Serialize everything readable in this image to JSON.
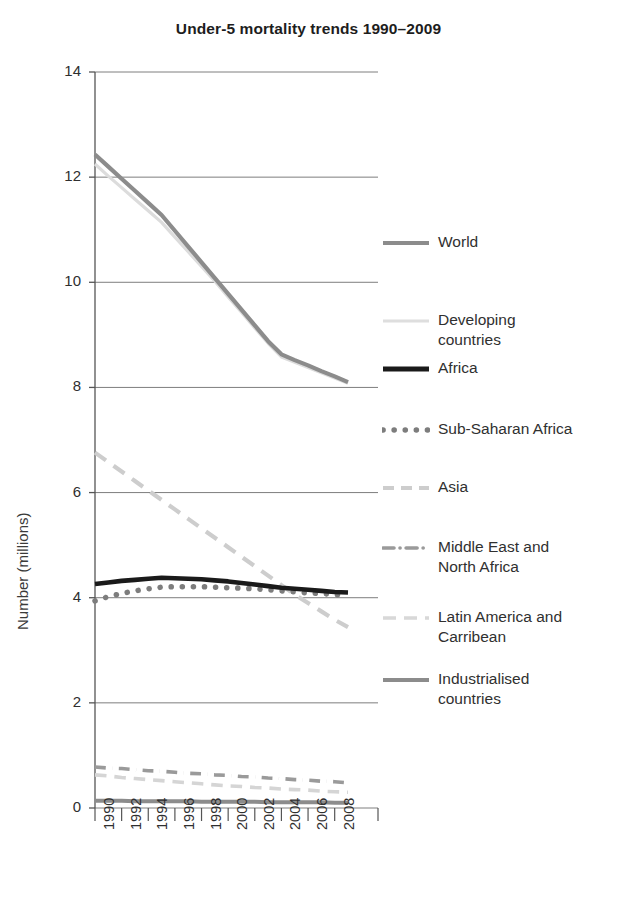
{
  "chart_data": {
    "type": "line",
    "title": "Under-5 mortality trends 1990–2009",
    "xlabel": "",
    "ylabel": "Number (millions)",
    "xlim": [
      1990,
      2009
    ],
    "ylim": [
      0,
      14
    ],
    "grid": true,
    "legend_position": "right",
    "x_ticks": [
      "1990",
      "1992",
      "1994",
      "1996",
      "1998",
      "2000",
      "2002",
      "2004",
      "2006",
      "2008"
    ],
    "y_ticks": [
      "0",
      "2",
      "4",
      "6",
      "8",
      "10",
      "12",
      "14"
    ],
    "x": [
      1990,
      1991,
      1992,
      1993,
      1994,
      1995,
      1996,
      1997,
      1998,
      1999,
      2000,
      2001,
      2002,
      2003,
      2004,
      2005,
      2006,
      2007,
      2008,
      2009
    ],
    "series": [
      {
        "name": "World",
        "style": "solid",
        "color": "#8c8c8c",
        "width": 4.2,
        "values": [
          12.43,
          12.2,
          11.97,
          11.74,
          11.51,
          11.28,
          10.98,
          10.68,
          10.38,
          10.08,
          9.78,
          9.48,
          9.18,
          8.88,
          8.63,
          8.52,
          8.42,
          8.31,
          8.21,
          8.1
        ]
      },
      {
        "name": "Developing countries",
        "style": "solid",
        "color": "#dcdcdc",
        "width": 3.2,
        "values": [
          12.25,
          12.02,
          11.8,
          11.58,
          11.36,
          11.14,
          10.86,
          10.58,
          10.3,
          10.02,
          9.72,
          9.43,
          9.13,
          8.84,
          8.58,
          8.48,
          8.38,
          8.28,
          8.18,
          8.08
        ]
      },
      {
        "name": "Africa",
        "style": "solid",
        "color": "#1a1a1a",
        "width": 4.6,
        "values": [
          4.26,
          4.29,
          4.32,
          4.34,
          4.36,
          4.38,
          4.37,
          4.36,
          4.35,
          4.33,
          4.31,
          4.28,
          4.25,
          4.22,
          4.19,
          4.17,
          4.15,
          4.13,
          4.11,
          4.1
        ]
      },
      {
        "name": "Sub-Saharan Africa",
        "style": "dotted",
        "color": "#7d7d7d",
        "width": 5.5,
        "values": [
          3.94,
          4.02,
          4.08,
          4.13,
          4.17,
          4.2,
          4.21,
          4.21,
          4.21,
          4.2,
          4.19,
          4.18,
          4.17,
          4.15,
          4.13,
          4.11,
          4.09,
          4.08,
          4.06,
          4.05
        ]
      },
      {
        "name": "Asia",
        "style": "dashed",
        "color": "#cdcdcd",
        "width": 4.2,
        "values": [
          6.76,
          6.58,
          6.4,
          6.22,
          6.04,
          5.86,
          5.68,
          5.5,
          5.32,
          5.14,
          4.96,
          4.78,
          4.6,
          4.42,
          4.24,
          4.06,
          3.9,
          3.74,
          3.58,
          3.44
        ]
      },
      {
        "name": "Middle East and North Africa",
        "style": "dashdot",
        "color": "#9a9a9a",
        "width": 3.6,
        "values": [
          0.78,
          0.76,
          0.75,
          0.73,
          0.71,
          0.7,
          0.68,
          0.66,
          0.65,
          0.63,
          0.62,
          0.6,
          0.59,
          0.57,
          0.56,
          0.54,
          0.53,
          0.51,
          0.5,
          0.48
        ]
      },
      {
        "name": "Latin America and Carribean",
        "style": "dashed",
        "color": "#d5d5d5",
        "width": 3.6,
        "values": [
          0.63,
          0.61,
          0.58,
          0.56,
          0.54,
          0.52,
          0.5,
          0.48,
          0.46,
          0.44,
          0.42,
          0.41,
          0.39,
          0.38,
          0.36,
          0.35,
          0.34,
          0.32,
          0.31,
          0.3
        ]
      },
      {
        "name": "Industrialised countries",
        "style": "solid",
        "color": "#8c8c8c",
        "width": 4.0,
        "values": [
          0.14,
          0.14,
          0.14,
          0.13,
          0.13,
          0.13,
          0.13,
          0.13,
          0.12,
          0.12,
          0.12,
          0.12,
          0.12,
          0.11,
          0.11,
          0.11,
          0.11,
          0.11,
          0.1,
          0.1
        ]
      }
    ]
  },
  "legend": {
    "items": [
      {
        "label": "World",
        "swatch": "solid-gray"
      },
      {
        "label": "Developing\ncountries",
        "swatch": "solid-light"
      },
      {
        "label": "Africa",
        "swatch": "solid-black"
      },
      {
        "label": "Sub-Saharan Africa",
        "swatch": "dotted-gray"
      },
      {
        "label": "Asia",
        "swatch": "dashed-light"
      },
      {
        "label": "Middle East and\nNorth Africa",
        "swatch": "dashdot-gray"
      },
      {
        "label": "Latin America and\nCarribean",
        "swatch": "dashed-verylight"
      },
      {
        "label": "Industrialised\ncountries",
        "swatch": "solid-gray"
      }
    ]
  },
  "axes": {
    "y_title": "Number (millions)"
  }
}
